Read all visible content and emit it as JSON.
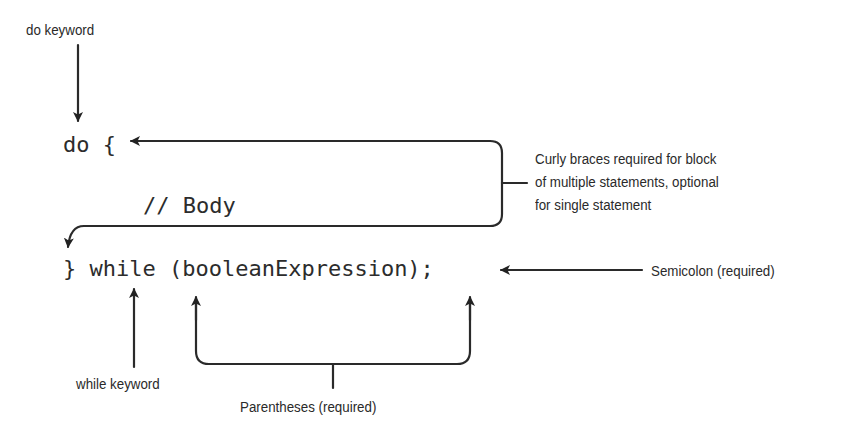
{
  "diagram": {
    "code": {
      "line1": "do {",
      "line2": "// Body",
      "line3": "} while (booleanExpression);"
    },
    "annotations": {
      "do_keyword": "do keyword",
      "braces": [
        "Curly braces required for block",
        "of multiple statements, optional",
        "for single statement"
      ],
      "semicolon": "Semicolon (required)",
      "while_keyword": "while keyword",
      "parentheses": "Parentheses (required)"
    },
    "colors": {
      "ink": "#2a2a2a",
      "background": "#ffffff"
    }
  }
}
